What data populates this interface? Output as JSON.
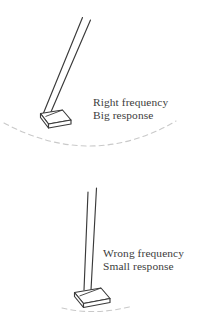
{
  "figure": {
    "background_color": "#ffffff",
    "ink_color": "#3a3a3a",
    "dash_color": "#c9c9c9",
    "text_color": "#3c3c3c"
  },
  "panels": [
    {
      "id": "big-response",
      "label_lines": [
        "Right frequency",
        "Big response"
      ],
      "rod_tilt_description": "tilted far to the right",
      "arc_description": "wide dashed swing arc spanning full width",
      "base_description": "parallelogram slab base in perspective"
    },
    {
      "id": "small-response",
      "label_lines": [
        "Wrong frequency",
        "Small response"
      ],
      "rod_tilt_description": "nearly vertical",
      "arc_description": "short dashed swing arc under the base",
      "base_description": "parallelogram slab base in perspective"
    }
  ],
  "labels": {
    "big_response": {
      "line1": "Right frequency",
      "line2": "Big response"
    },
    "small_response": {
      "line1": "Wrong frequency",
      "line2": "Small response"
    }
  }
}
